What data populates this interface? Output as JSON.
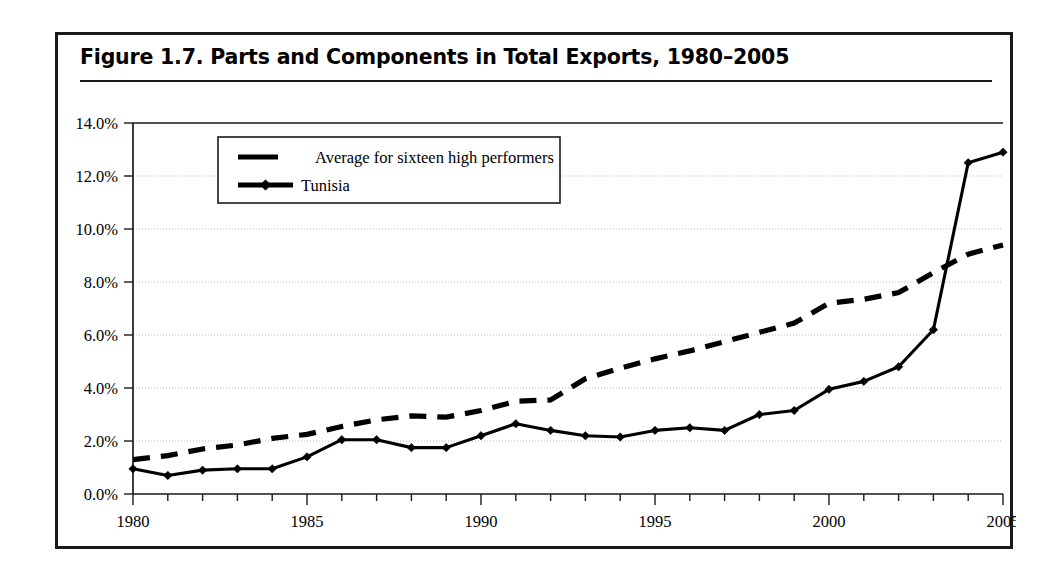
{
  "figure": {
    "title": "Figure 1.7.  Parts and Components in Total Exports, 1980–2005"
  },
  "chart_data": {
    "type": "line",
    "title": "Figure 1.7.  Parts and Components in Total Exports, 1980–2005",
    "xlabel": "",
    "ylabel": "",
    "xlim": [
      1980,
      2005
    ],
    "ylim": [
      0.0,
      14.0
    ],
    "y_tick_labels": [
      "0.0%",
      "2.0%",
      "4.0%",
      "6.0%",
      "8.0%",
      "10.0%",
      "12.0%",
      "14.0%"
    ],
    "y_tick_values": [
      0.0,
      2.0,
      4.0,
      6.0,
      8.0,
      10.0,
      12.0,
      14.0
    ],
    "x_tick_labels": [
      "1980",
      "1985",
      "1990",
      "1995",
      "2000",
      "2005"
    ],
    "x_tick_values": [
      1980,
      1985,
      1990,
      1995,
      2000,
      2005
    ],
    "x_minor_tick_step": 1,
    "grid": "horizontal-dotted",
    "legend_position": "upper-left-inside",
    "units": "percent",
    "x": [
      1980,
      1981,
      1982,
      1983,
      1984,
      1985,
      1986,
      1987,
      1988,
      1989,
      1990,
      1991,
      1992,
      1993,
      1994,
      1995,
      1996,
      1997,
      1998,
      1999,
      2000,
      2001,
      2002,
      2003,
      2004,
      2005
    ],
    "series": [
      {
        "name": "Average for sixteen high performers",
        "style": "dashed",
        "marker": "none",
        "color": "#000000",
        "values": [
          1.3,
          1.45,
          1.7,
          1.85,
          2.1,
          2.25,
          2.55,
          2.8,
          2.95,
          2.9,
          3.15,
          3.5,
          3.55,
          4.35,
          4.75,
          5.1,
          5.4,
          5.75,
          6.1,
          6.45,
          7.2,
          7.35,
          7.6,
          8.35,
          9.05,
          9.4
        ]
      },
      {
        "name": "Tunisia",
        "style": "solid",
        "marker": "diamond",
        "color": "#000000",
        "values": [
          0.95,
          0.7,
          0.9,
          0.95,
          0.95,
          1.4,
          2.05,
          2.05,
          1.75,
          1.75,
          2.2,
          2.65,
          2.4,
          2.2,
          2.15,
          2.4,
          2.5,
          2.4,
          3.0,
          3.15,
          3.95,
          4.25,
          4.8,
          6.2,
          12.5,
          12.9
        ]
      }
    ]
  },
  "legend": {
    "items": [
      {
        "label": "Average for sixteen high performers",
        "style": "dashed",
        "marker": "none"
      },
      {
        "label": "Tunisia",
        "style": "solid",
        "marker": "diamond"
      }
    ]
  }
}
